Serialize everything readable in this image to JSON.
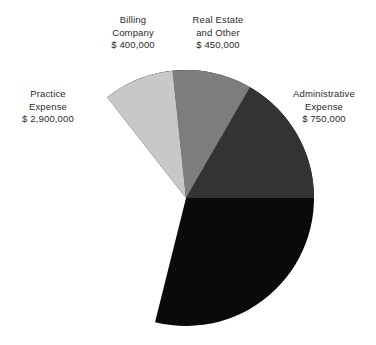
{
  "chart_data": {
    "type": "pie",
    "title": "",
    "subtitle": "",
    "xlabel": "",
    "ylabel": "",
    "legend_position": "callout-labels",
    "grid": false,
    "currency_symbol": "$",
    "total": 4500000,
    "start_angle_deg": -38,
    "direction": "clockwise",
    "center": {
      "x": 186,
      "y": 198
    },
    "radius": 128,
    "categories": [
      "Practice Expense",
      "Administrative Expense",
      "Real Estate and Other",
      "Billing Company"
    ],
    "values": [
      2900000,
      750000,
      450000,
      400000
    ],
    "slices": [
      {
        "key": "practice",
        "name": "Practice Expense",
        "name_line1": "Practice",
        "name_line2": "Expense",
        "value": 2900000,
        "value_label": "$ 2,900,000",
        "percent": 64.4,
        "angle_deg": 232,
        "start_deg": -38,
        "end_deg": 194,
        "color": "#0a0a0a"
      },
      {
        "key": "administrative",
        "name": "Administrative Expense",
        "name_line1": "Administrative",
        "name_line2": "Expense",
        "value": 750000,
        "value_label": "$ 750,000",
        "percent": 16.7,
        "angle_deg": 60,
        "start_deg": 30,
        "end_deg": 90,
        "color": "#333333"
      },
      {
        "key": "real_estate",
        "name": "Real Estate and Other",
        "name_line1": "Real Estate",
        "name_line2": "and Other",
        "value": 450000,
        "value_label": "$ 450,000",
        "percent": 10.0,
        "angle_deg": 36,
        "start_deg": -6,
        "end_deg": 30,
        "color": "#7d7d7d"
      },
      {
        "key": "billing",
        "name": "Billing Company",
        "name_line1": "Billing",
        "name_line2": "Company",
        "value": 400000,
        "value_label": "$ 400,000",
        "percent": 8.9,
        "angle_deg": 32,
        "start_deg": -38,
        "end_deg": -6,
        "color": "#c8c8c8"
      }
    ]
  },
  "labels": {
    "billing": {
      "line1": "Billing",
      "line2": "Company",
      "line3": "$ 400,000"
    },
    "real_estate": {
      "line1": "Real Estate",
      "line2": "and Other",
      "line3": "$ 450,000"
    },
    "practice": {
      "line1": "Practice",
      "line2": "Expense",
      "line3": "$ 2,900,000"
    },
    "administrative": {
      "line1": "Administrative",
      "line2": "Expense",
      "line3": "$ 750,000"
    }
  },
  "colors": {
    "background": "#ffffff",
    "text": "#2b2b2b",
    "practice": "#0a0a0a",
    "administrative": "#333333",
    "real_estate": "#7d7d7d",
    "billing": "#c8c8c8"
  }
}
